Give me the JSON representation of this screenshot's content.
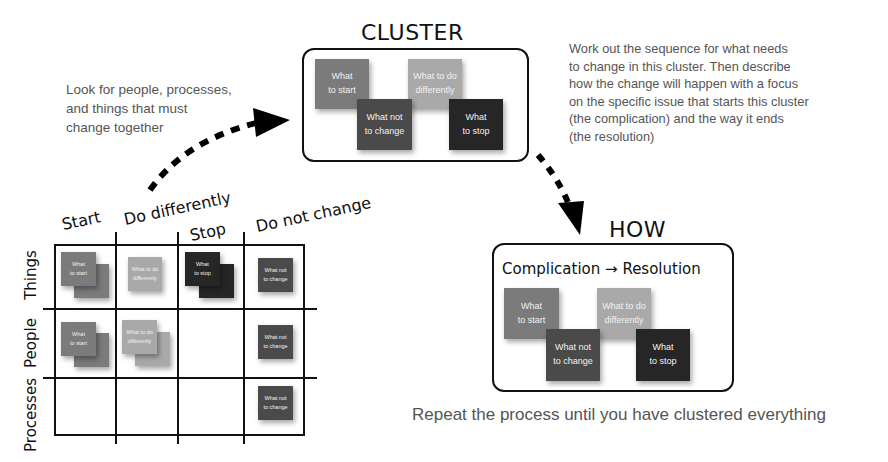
{
  "cluster": {
    "title": "CLUSTER",
    "notes": [
      {
        "label": "What\nto start",
        "type": "start"
      },
      {
        "label": "What not\nto change",
        "type": "nochange"
      },
      {
        "label": "What to do\ndifferently",
        "type": "diff"
      },
      {
        "label": "What\nto stop",
        "type": "stop"
      }
    ]
  },
  "how": {
    "title": "HOW",
    "subtitle": "Complication → Resolution",
    "notes": [
      {
        "label": "What\nto start",
        "type": "start"
      },
      {
        "label": "What not\nto change",
        "type": "nochange"
      },
      {
        "label": "What to do\ndifferently",
        "type": "diff"
      },
      {
        "label": "What\nto stop",
        "type": "stop"
      }
    ]
  },
  "annotations": {
    "look_for": "Look for people, processes,\nand things that must\nchange together",
    "work_out": "Work out the sequence for what needs\nto change in this cluster. Then describe\nhow the change will happen with a focus\non the specific issue that starts this cluster\n(the complication) and the way it ends\n(the resolution)",
    "repeat": "Repeat the process until you have clustered everything"
  },
  "matrix": {
    "columns": [
      "Start",
      "Do differently",
      "Stop",
      "Do not change"
    ],
    "rows": [
      "Things",
      "People",
      "Processes"
    ],
    "cells": {
      "things_start": "What\nto start",
      "things_diff": "What to do\ndifferently",
      "things_stop": "What\nto stop",
      "things_nochange": "What not\nto change",
      "people_start": "What\nto start",
      "people_diff": "What to do\ndifferently",
      "people_nochange": "What not\nto change",
      "processes_nochange": "What not\nto change"
    }
  },
  "colors": {
    "start": "#7b7b7b",
    "differently": "#a9a9a9",
    "not_change": "#4a4a4a",
    "stop": "#262626",
    "annotation_text": "#555555",
    "lines": "#111111"
  }
}
